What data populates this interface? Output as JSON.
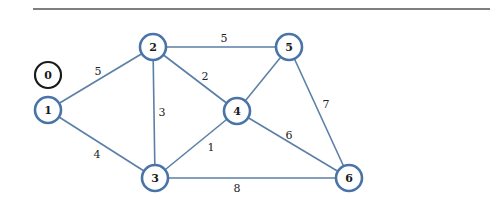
{
  "diagram": {
    "type": "weighted-undirected-graph",
    "colors": {
      "edge": "#5b7fa6",
      "node_stroke": "#4a74a8",
      "isolated_node_stroke": "#1a1a1a",
      "text": "#1a1a1a",
      "rule": "#555555"
    },
    "rule": {
      "x1": 33,
      "y1": 9,
      "x2": 490,
      "y2": 9
    },
    "node_radius": 13,
    "nodes": [
      {
        "id": "0",
        "label": "0",
        "x": 48,
        "y": 75,
        "isolated": true
      },
      {
        "id": "1",
        "label": "1",
        "x": 48,
        "y": 110,
        "isolated": false
      },
      {
        "id": "2",
        "label": "2",
        "x": 153,
        "y": 47,
        "isolated": false
      },
      {
        "id": "3",
        "label": "3",
        "x": 155,
        "y": 178,
        "isolated": false
      },
      {
        "id": "4",
        "label": "4",
        "x": 237,
        "y": 111,
        "isolated": false
      },
      {
        "id": "5",
        "label": "5",
        "x": 289,
        "y": 47,
        "isolated": false
      },
      {
        "id": "6",
        "label": "6",
        "x": 349,
        "y": 178,
        "isolated": false
      }
    ],
    "edges": [
      {
        "from": "1",
        "to": "2",
        "weight": "5",
        "lx": 98,
        "ly": 71
      },
      {
        "from": "1",
        "to": "3",
        "weight": "4",
        "lx": 97,
        "ly": 154
      },
      {
        "from": "2",
        "to": "5",
        "weight": "5",
        "lx": 224,
        "ly": 38
      },
      {
        "from": "2",
        "to": "4",
        "weight": "2",
        "lx": 205,
        "ly": 76
      },
      {
        "from": "2",
        "to": "3",
        "weight": "3",
        "lx": 162,
        "ly": 112
      },
      {
        "from": "3",
        "to": "4",
        "weight": "1",
        "lx": 211,
        "ly": 147
      },
      {
        "from": "3",
        "to": "6",
        "weight": "8",
        "lx": 237,
        "ly": 188
      },
      {
        "from": "4",
        "to": "5",
        "weight": "",
        "lx": 0,
        "ly": 0
      },
      {
        "from": "4",
        "to": "6",
        "weight": "6",
        "lx": 289,
        "ly": 135
      },
      {
        "from": "5",
        "to": "6",
        "weight": "7",
        "lx": 326,
        "ly": 104
      }
    ]
  }
}
